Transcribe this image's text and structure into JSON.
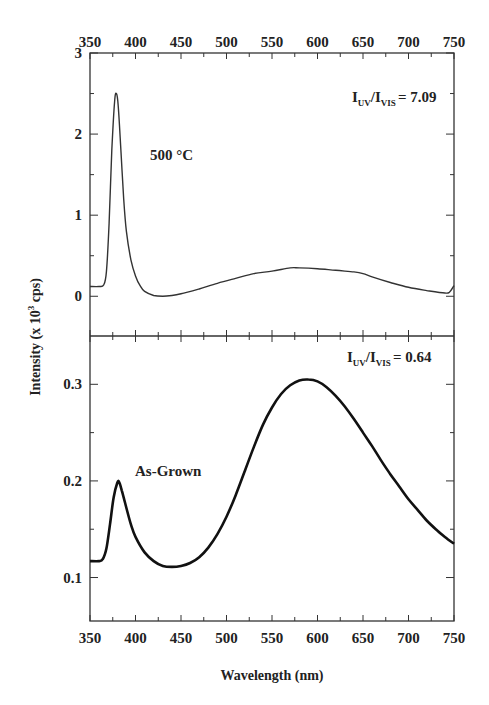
{
  "figure": {
    "ylabel_main": "Intensity (x 10",
    "ylabel_sup": "3",
    "ylabel_tail": " cps)",
    "xlabel": "Wavelength (nm)"
  },
  "chart_data": [
    {
      "type": "line",
      "panel": "top",
      "title": "",
      "annotation": "500 °C",
      "ratio_label": {
        "base1": "I",
        "sub1": "UV",
        "slash": "/",
        "base2": "I",
        "sub2": "VIS",
        "value": "= 7.09"
      },
      "xlabel": "Wavelength (nm)",
      "ylabel": "Intensity (x 10^3 cps)",
      "xlim": [
        350,
        750
      ],
      "ylim": [
        -0.49,
        3
      ],
      "xticks": [
        350,
        400,
        450,
        500,
        550,
        600,
        650,
        700,
        750
      ],
      "xtick_labels_top": [
        "350",
        "400",
        "450",
        "500",
        "550",
        "600",
        "650",
        "700",
        "750"
      ],
      "yticks": [
        0,
        1,
        2,
        3
      ],
      "ytick_labels": [
        "0",
        "1",
        "2",
        "3"
      ],
      "minor_yticks": [
        0.5,
        1.5,
        2.5
      ],
      "grid": false,
      "series": [
        {
          "name": "500 °C",
          "x": [
            350,
            360,
            365,
            368,
            371,
            374,
            377,
            379,
            381,
            384,
            387,
            390,
            395,
            400,
            405,
            410,
            420,
            430,
            440,
            450,
            470,
            490,
            510,
            530,
            550,
            570,
            580,
            600,
            620,
            640,
            650,
            660,
            680,
            700,
            720,
            740,
            745,
            750
          ],
          "y": [
            0.12,
            0.12,
            0.14,
            0.3,
            0.9,
            1.8,
            2.4,
            2.5,
            2.35,
            1.8,
            1.2,
            0.8,
            0.45,
            0.25,
            0.13,
            0.06,
            0.01,
            0.0,
            0.01,
            0.03,
            0.09,
            0.16,
            0.22,
            0.28,
            0.31,
            0.35,
            0.35,
            0.34,
            0.32,
            0.3,
            0.28,
            0.24,
            0.17,
            0.11,
            0.07,
            0.04,
            0.05,
            0.13
          ],
          "color": "#333333"
        }
      ]
    },
    {
      "type": "line",
      "panel": "bottom",
      "title": "",
      "annotation": "As-Grown",
      "ratio_label": {
        "base1": "I",
        "sub1": "UV",
        "slash": "/",
        "base2": "I",
        "sub2": "VIS",
        "value": "= 0.64"
      },
      "xlabel": "Wavelength (nm)",
      "ylabel": "Intensity (x 10^3 cps)",
      "xlim": [
        350,
        750
      ],
      "ylim": [
        0.055,
        0.35
      ],
      "xticks": [
        350,
        400,
        450,
        500,
        550,
        600,
        650,
        700,
        750
      ],
      "xtick_labels_bottom": [
        "350",
        "400",
        "450",
        "500",
        "550",
        "600",
        "650",
        "700",
        "750"
      ],
      "yticks": [
        0.1,
        0.2,
        0.3
      ],
      "ytick_labels": [
        "0.1",
        "0.2",
        "0.3"
      ],
      "minor_yticks": [
        0.15,
        0.25
      ],
      "grid": false,
      "series": [
        {
          "name": "As-Grown",
          "x": [
            350,
            360,
            364,
            368,
            372,
            376,
            380,
            382,
            385,
            390,
            395,
            400,
            410,
            420,
            430,
            440,
            450,
            460,
            470,
            480,
            490,
            500,
            510,
            520,
            530,
            540,
            550,
            560,
            570,
            580,
            590,
            600,
            610,
            620,
            630,
            640,
            650,
            660,
            670,
            680,
            690,
            700,
            710,
            720,
            730,
            740,
            750
          ],
          "y": [
            0.117,
            0.117,
            0.119,
            0.13,
            0.155,
            0.183,
            0.198,
            0.199,
            0.19,
            0.172,
            0.155,
            0.142,
            0.126,
            0.117,
            0.112,
            0.111,
            0.112,
            0.115,
            0.121,
            0.131,
            0.145,
            0.163,
            0.185,
            0.21,
            0.235,
            0.258,
            0.276,
            0.29,
            0.299,
            0.304,
            0.305,
            0.303,
            0.297,
            0.288,
            0.277,
            0.264,
            0.25,
            0.236,
            0.221,
            0.207,
            0.194,
            0.181,
            0.17,
            0.159,
            0.15,
            0.142,
            0.135
          ],
          "color": "#111111"
        }
      ]
    }
  ]
}
